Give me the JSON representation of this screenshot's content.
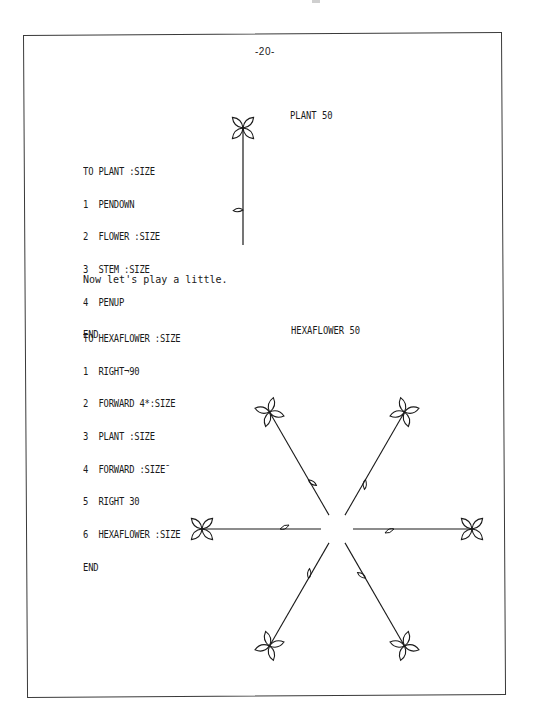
{
  "page": {
    "number": "-20-"
  },
  "plant_procedure": {
    "lines": [
      "TO PLANT :SIZE",
      "1  PENDOWN",
      "2  FLOWER :SIZE",
      "3  STEM :SIZE",
      "4  PENUP",
      "END"
    ]
  },
  "plant_figure": {
    "caption": "PLANT 50"
  },
  "intro_text": "Now let's play a little.",
  "hexaflower_procedure": {
    "lines": [
      "TO HEXAFLOWER :SIZE",
      "1  RIGHT¬90",
      "2  FORWARD 4*:SIZE",
      "3  PLANT :SIZE",
      "4  FORWARD :SIZE¯",
      "5  RIGHT 30",
      "6  HEXAFLOWER :SIZE",
      "END"
    ]
  },
  "hexaflower_figure": {
    "caption": "HEXAFLOWER 50",
    "flower_count": 6
  },
  "colors": {
    "ink": "#1a1a1a",
    "paper": "#ffffff",
    "frame": "#3a3a3a"
  }
}
